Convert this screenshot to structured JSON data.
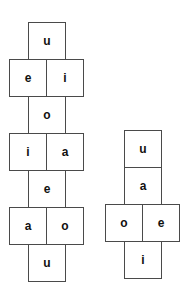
{
  "diagram": {
    "type": "cube-net",
    "colors": {
      "cell_border": "#4a4a4a",
      "cell_fill": "#ffffff",
      "letter": "#111111",
      "background": "#ffffff"
    },
    "nets": [
      {
        "id": "net-left",
        "cell_count": 10,
        "rows": [
          {
            "id": "left-row-1",
            "width": "single",
            "cells": [
              {
                "id": "left-r1-c1",
                "letter": "u"
              }
            ]
          },
          {
            "id": "left-row-2",
            "width": "double",
            "cells": [
              {
                "id": "left-r2-c1",
                "letter": "e"
              },
              {
                "id": "left-r2-c2",
                "letter": "i"
              }
            ]
          },
          {
            "id": "left-row-3",
            "width": "single",
            "cells": [
              {
                "id": "left-r3-c1",
                "letter": "o"
              }
            ]
          },
          {
            "id": "left-row-4",
            "width": "double",
            "cells": [
              {
                "id": "left-r4-c1",
                "letter": "i"
              },
              {
                "id": "left-r4-c2",
                "letter": "a"
              }
            ]
          },
          {
            "id": "left-row-5",
            "width": "single",
            "cells": [
              {
                "id": "left-r5-c1",
                "letter": "e"
              }
            ]
          },
          {
            "id": "left-row-6",
            "width": "double",
            "cells": [
              {
                "id": "left-r6-c1",
                "letter": "a"
              },
              {
                "id": "left-r6-c2",
                "letter": "o"
              }
            ]
          },
          {
            "id": "left-row-7",
            "width": "single",
            "cells": [
              {
                "id": "left-r7-c1",
                "letter": "u"
              }
            ]
          }
        ]
      },
      {
        "id": "net-right",
        "cell_count": 5,
        "rows": [
          {
            "id": "right-row-1",
            "width": "single",
            "cells": [
              {
                "id": "right-r1-c1",
                "letter": "u"
              }
            ]
          },
          {
            "id": "right-row-2",
            "width": "single",
            "cells": [
              {
                "id": "right-r2-c1",
                "letter": "a"
              }
            ]
          },
          {
            "id": "right-row-3",
            "width": "double",
            "cells": [
              {
                "id": "right-r3-c1",
                "letter": "o"
              },
              {
                "id": "right-r3-c2",
                "letter": "e"
              }
            ]
          },
          {
            "id": "right-row-4",
            "width": "single",
            "cells": [
              {
                "id": "right-r4-c1",
                "letter": "i"
              }
            ]
          }
        ]
      }
    ]
  }
}
